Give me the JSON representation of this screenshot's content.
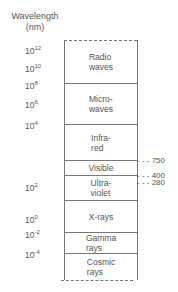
{
  "axis": {
    "title_line1": "Wavelength",
    "title_line2": "(nm)",
    "ticks": [
      {
        "base": "10",
        "exp": "12"
      },
      {
        "base": "10",
        "exp": "10"
      },
      {
        "base": "10",
        "exp": "8"
      },
      {
        "base": "10",
        "exp": "6"
      },
      {
        "base": "10",
        "exp": "4"
      },
      {
        "base": "10",
        "exp": "2"
      },
      {
        "base": "10",
        "exp": "0"
      },
      {
        "base": "10",
        "exp": "-2"
      },
      {
        "base": "10",
        "exp": "-4"
      }
    ]
  },
  "bands": [
    {
      "line1": "Radio",
      "line2": "waves"
    },
    {
      "line1": "Micro-",
      "line2": "waves"
    },
    {
      "line1": "Infra-",
      "line2": "red"
    },
    {
      "line1": "Visible",
      "line2": ""
    },
    {
      "line1": "Ultra-",
      "line2": "violet"
    },
    {
      "line1": "X-rays",
      "line2": ""
    },
    {
      "line1": "Gamma",
      "line2": "rays"
    },
    {
      "line1": "Cosmic",
      "line2": "rays"
    }
  ],
  "markers": [
    {
      "label": "750"
    },
    {
      "label": "400"
    },
    {
      "label": "280"
    }
  ]
}
